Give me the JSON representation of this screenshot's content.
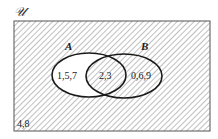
{
  "diagram": {
    "type": "venn",
    "universe_label": "𝒰",
    "sets": [
      {
        "name": "A",
        "label": "A"
      },
      {
        "name": "B",
        "label": "B"
      }
    ],
    "regions": {
      "a_only": "1,5,7",
      "a_and_b": "2,3",
      "b_only": "0,6,9",
      "outside": "4,8"
    },
    "shaded_regions": [
      "a_and_b",
      "b_only",
      "outside"
    ],
    "unshaded_regions": [
      "a_only"
    ],
    "colors": {
      "stroke": "#1a1a1a",
      "hatch": "#8a8a8a",
      "background": "#ffffff"
    }
  }
}
